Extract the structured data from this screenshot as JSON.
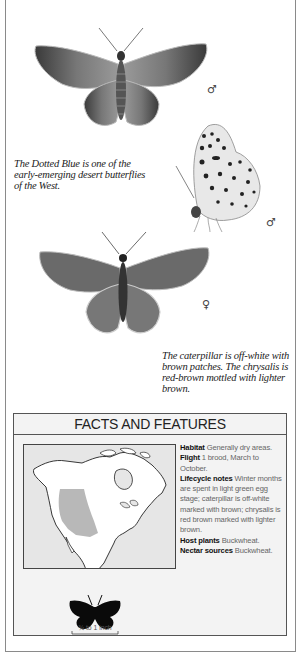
{
  "illustrations": [
    {
      "id": "male-upperside",
      "label": "Dotted Blue male, upperside",
      "sex_symbol": "♂"
    },
    {
      "id": "male-underside",
      "label": "Dotted Blue male, underside",
      "sex_symbol": "♂"
    },
    {
      "id": "female-upperside",
      "label": "Dotted Blue female, upperside",
      "sex_symbol": "♀"
    }
  ],
  "captions": {
    "intro": [
      "The Dotted Blue is one of the",
      "early-emerging desert butterflies",
      "of the West."
    ],
    "caterpillar": [
      "The caterpillar is off-white with",
      "brown patches. The chrysalis is",
      "red-brown mottled with lighter",
      "brown."
    ]
  },
  "facts": {
    "title": "FACTS AND FEATURES",
    "items": [
      {
        "label": "Habitat",
        "text": "Generally dry areas."
      },
      {
        "label": "Flight",
        "text": "1 brood, March to October."
      },
      {
        "label": "Lifecycle notes",
        "text": "Winter months are spent in light green egg stage; caterpillar is off-white marked with brown; chrysalis is red brown marked with lighter brown."
      },
      {
        "label": "Host plants",
        "text": "Buckwheat."
      },
      {
        "label": "Nectar sources",
        "text": "Buckwheat."
      }
    ],
    "map": {
      "region": "North America",
      "range_shading": "Western interior USA",
      "range_color": "#b8b8b8"
    },
    "size": {
      "label": "¾ to 1 inch"
    }
  },
  "colors": {
    "frame": "#8a8a8a",
    "box_bg": "#f3f3f3",
    "map_sea": "#e6e6e6",
    "map_range": "#b8b8b8"
  }
}
